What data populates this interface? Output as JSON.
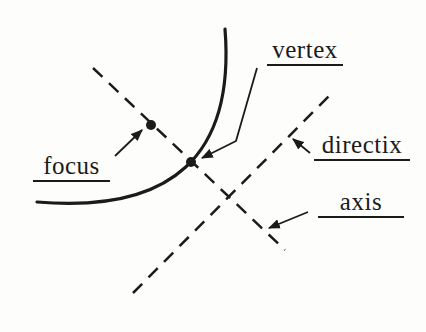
{
  "colors": {
    "bg": "#fdfdfb",
    "ink": "#1b1b1b"
  },
  "diagram": {
    "type": "parabola-parts-figure",
    "labels": {
      "vertex": "vertex",
      "focus": "focus",
      "directrix": "directix",
      "axis": "axis"
    }
  }
}
